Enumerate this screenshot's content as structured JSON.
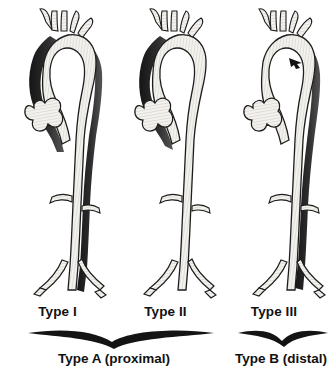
{
  "figure": {
    "background_color": "#ffffff",
    "ink_color": "#1a1a1a",
    "lumen_color": "#f2f0ec",
    "dissection_color": "#262626"
  },
  "panels": [
    {
      "id": "type-1",
      "label": "Type I",
      "dissection_extent": "ascending aorta, arch and descending aorta",
      "has_descending_dissection": true,
      "has_ascending_dissection": true
    },
    {
      "id": "type-2",
      "label": "Type II",
      "dissection_extent": "ascending aorta only",
      "has_descending_dissection": false,
      "has_ascending_dissection": true
    },
    {
      "id": "type-3",
      "label": "Type III",
      "dissection_extent": "descending aorta distal to left subclavian artery",
      "has_descending_dissection": true,
      "has_ascending_dissection": false
    }
  ],
  "groups": [
    {
      "id": "group-a",
      "label": "Type A (proximal)",
      "covers": [
        "Type I",
        "Type II"
      ]
    },
    {
      "id": "group-b",
      "label": "Type B (distal)",
      "covers": [
        "Type III"
      ]
    }
  ],
  "anatomy": {
    "arch_branches": [
      "brachiocephalic",
      "left common carotid",
      "left subclavian"
    ],
    "root": "aortic root with sinuses of Valsalva",
    "abdominal_branches": [
      "renal artery",
      "renal artery"
    ],
    "bifurcation": "common iliac arteries"
  },
  "annotations": [
    {
      "id": "tear-arrow-type-3",
      "name": "intimal-tear-arrow",
      "panel": "type-3"
    }
  ]
}
